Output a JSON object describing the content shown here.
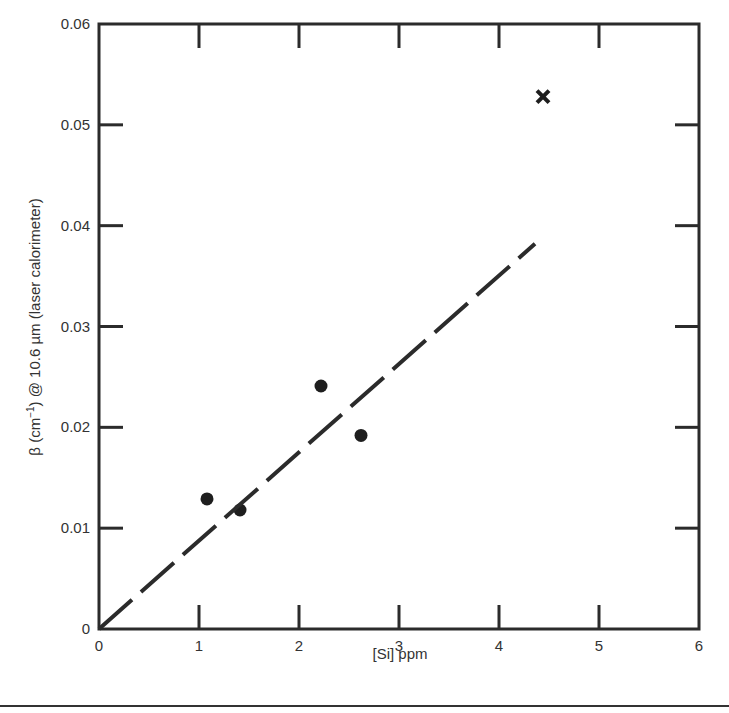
{
  "chart_data": {
    "type": "scatter",
    "title": "",
    "xlabel": "[Si] ppm",
    "ylabel": "β (cm⁻¹) @ 10.6 µm (laser calorimeter)",
    "xlim": [
      0,
      6
    ],
    "ylim": [
      0,
      0.06
    ],
    "x_ticks": [
      "0",
      "1",
      "2",
      "3",
      "4",
      "5",
      "6"
    ],
    "y_ticks": [
      "0",
      "0.01",
      "0.02",
      "0.03",
      "0.04",
      "0.05",
      "0.06"
    ],
    "grid": false,
    "legend": null,
    "series": [
      {
        "name": "measured",
        "marker": "filled-circle",
        "x": [
          1.08,
          1.41,
          2.22,
          2.62
        ],
        "y": [
          0.0129,
          0.0118,
          0.0241,
          0.0192
        ]
      },
      {
        "name": "outlier",
        "marker": "x",
        "x": [
          4.44
        ],
        "y": [
          0.0528
        ]
      },
      {
        "name": "fit",
        "style": "dashed-line",
        "x": [
          0,
          4.36
        ],
        "y": [
          0,
          0.0382
        ]
      }
    ]
  },
  "labels": {
    "xlabel": "[Si] ppm",
    "ylabel_pre": "β (cm",
    "ylabel_sup": "−1",
    "ylabel_post": ") @ 10.6 µm (laser calorimeter)"
  }
}
